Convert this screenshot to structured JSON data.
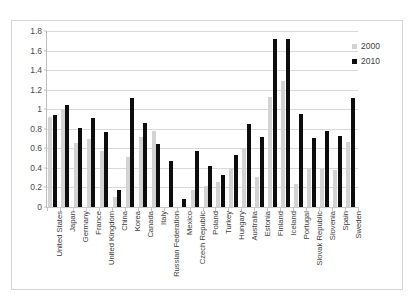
{
  "chart_data": {
    "type": "bar",
    "title": "",
    "subtitle": "",
    "xlabel": "",
    "ylabel": "",
    "ylim": [
      0,
      1.8
    ],
    "ytick_step": 0.2,
    "yticks": [
      "0",
      "0.2",
      "0.4",
      "0.6",
      "0.8",
      "1",
      "1.2",
      "1.4",
      "1.6",
      "1.8"
    ],
    "grid": true,
    "legend_position": "top-right",
    "orientation": "vertical",
    "grouping": "grouped",
    "xtick_label_rotation": -90,
    "categories": [
      "United States",
      "Japan",
      "Germany",
      "France",
      "United Kingdom",
      "China",
      "Korea",
      "Canada",
      "Italy",
      "Russian Federation",
      "Mexico",
      "Czech Republic",
      "Poland",
      "Turkey",
      "Hungary",
      "Australia",
      "Estonia",
      "Finland",
      "Iceland",
      "Portugal",
      "Slovak Republic",
      "Slovenia",
      "Spain",
      "Sweden"
    ],
    "series": [
      {
        "name": "2000",
        "color": "#d3d3d3",
        "values": [
          0.92,
          1.0,
          0.65,
          0.7,
          0.57,
          0.1,
          0.51,
          0.72,
          0.78,
          0.0,
          0.0,
          0.17,
          0.22,
          0.26,
          0.39,
          0.6,
          0.31,
          1.13,
          1.29,
          0.24,
          0.4,
          0.39,
          0.38,
          0.66
        ],
        "note_zero_categories": [
          "Russian Federation",
          "Mexico"
        ]
      },
      {
        "name": "2010",
        "color": "#0d0d0d",
        "values": [
          0.94,
          1.04,
          0.81,
          0.91,
          0.77,
          0.17,
          1.12,
          0.86,
          0.64,
          0.47,
          0.08,
          0.57,
          0.42,
          0.33,
          0.53,
          0.85,
          0.72,
          1.72,
          1.72,
          0.95,
          0.71,
          0.78,
          0.73,
          1.11
        ]
      }
    ]
  },
  "legend": {
    "entries": [
      {
        "label": "2000",
        "color": "#d3d3d3"
      },
      {
        "label": "2010",
        "color": "#0d0d0d"
      }
    ]
  },
  "colors": {
    "series_2000": "#d3d3d3",
    "series_2010": "#0d0d0d",
    "gridline": "#d9d9d9",
    "axis": "#bdbdbd",
    "frame_border": "#d5d5d5",
    "text": "#3d3d3d",
    "background": "#ffffff"
  }
}
